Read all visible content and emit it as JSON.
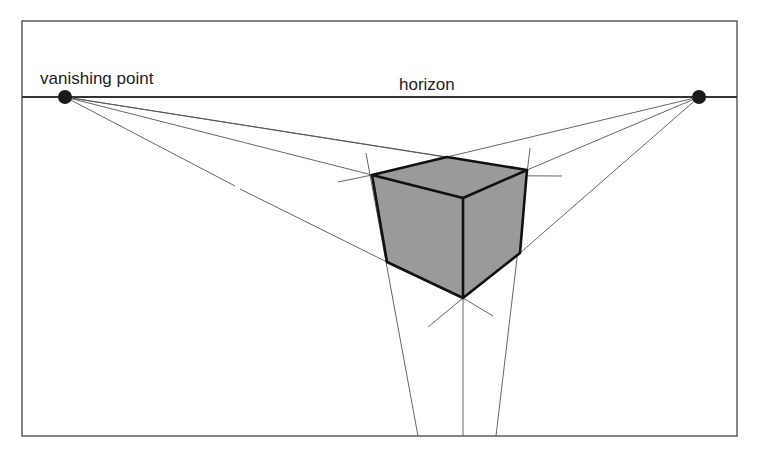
{
  "labels": {
    "vanishing_point": "vanishing point",
    "horizon": "horizon"
  },
  "colors": {
    "background": "#ffffff",
    "frame": "#444444",
    "guide": "#555555",
    "edge": "#111111",
    "cube_fill": "#9a9a9a",
    "point": "#1a1a1a"
  },
  "geometry": {
    "frame": {
      "x": 22,
      "y": 21,
      "w": 715,
      "h": 415
    },
    "horizon_y": 97,
    "vanishing_points": [
      {
        "x": 65,
        "y": 97
      },
      {
        "x": 699,
        "y": 97
      }
    ],
    "cube_vertices": {
      "top_left": [
        372,
        175
      ],
      "top_back": [
        447,
        157
      ],
      "top_right": [
        527,
        170
      ],
      "front_top": [
        463,
        198
      ],
      "bottom_left": [
        387,
        262
      ],
      "bottom_front": [
        463,
        298
      ],
      "bottom_right": [
        520,
        253
      ]
    }
  }
}
